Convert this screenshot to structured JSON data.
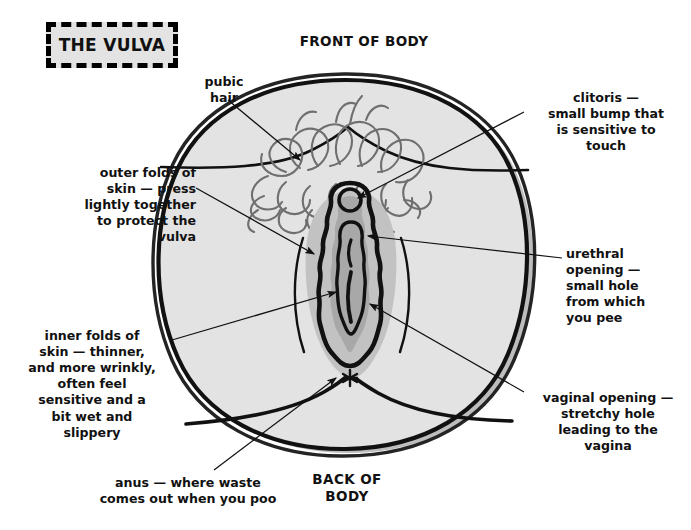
{
  "title": {
    "text": "THE VULVA"
  },
  "orientation": {
    "front": "FRONT OF BODY",
    "back": "BACK OF\nBODY",
    "back_line1": "BACK OF",
    "back_line2": "BODY"
  },
  "labels": {
    "pubic_hair": "pubic\nhair",
    "clitoris": "clitoris —\nsmall bump that\nis sensitive to\ntouch",
    "outer_folds": "outer folds of\nskin — press\nlightly together\nto protect the\nvulva",
    "urethral_opening": "urethral\nopening —\nsmall hole\nfrom which\nyou pee",
    "inner_folds": "inner folds of\nskin — thinner,\nand more wrinkly,\noften feel\nsensitive and a\nbit wet and\nslippery",
    "vaginal_opening": "vaginal opening —\nstretchy hole\nleading to the\nvagina",
    "anus": "anus — where waste\ncomes out when you poo"
  },
  "anatomy_parts": [
    "pubic-hair",
    "clitoris",
    "outer-folds-of-skin",
    "inner-folds-of-skin",
    "urethral-opening",
    "vaginal-opening",
    "anus"
  ],
  "colors": {
    "ink": "#111111",
    "body_fill": "#e3e3e3",
    "vulva_shadow": "#c2c2c2",
    "vulva_inner": "#a8a8a8",
    "hair_stroke": "#6f6f6f",
    "page_background": "#ffffff",
    "title_fill": "#e3e3e3"
  }
}
